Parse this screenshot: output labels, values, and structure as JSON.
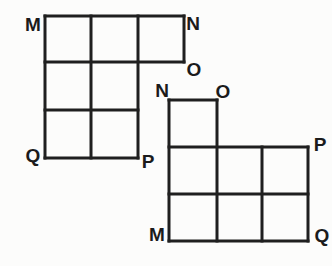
{
  "diagram": {
    "background": "#fcfcfb",
    "line_color": "#1f1f1f",
    "line_width": 3,
    "label_color": "#1b1b1b",
    "figures": [
      {
        "name": "figure-left",
        "segments": [
          {
            "x1": 45,
            "y1": 16,
            "x2": 184,
            "y2": 16
          },
          {
            "x1": 45,
            "y1": 62,
            "x2": 184,
            "y2": 62
          },
          {
            "x1": 45,
            "y1": 110,
            "x2": 138,
            "y2": 110
          },
          {
            "x1": 45,
            "y1": 158,
            "x2": 138,
            "y2": 158
          },
          {
            "x1": 45,
            "y1": 16,
            "x2": 45,
            "y2": 158
          },
          {
            "x1": 91,
            "y1": 16,
            "x2": 91,
            "y2": 158
          },
          {
            "x1": 138,
            "y1": 16,
            "x2": 138,
            "y2": 158
          },
          {
            "x1": 184,
            "y1": 16,
            "x2": 184,
            "y2": 62
          }
        ],
        "labels": [
          {
            "text": "M",
            "x": 33,
            "y": 24
          },
          {
            "text": "N",
            "x": 193,
            "y": 23
          },
          {
            "text": "O",
            "x": 194,
            "y": 69
          },
          {
            "text": "Q",
            "x": 33,
            "y": 155
          },
          {
            "text": "P",
            "x": 148,
            "y": 161
          }
        ]
      },
      {
        "name": "figure-right",
        "segments": [
          {
            "x1": 169,
            "y1": 100,
            "x2": 217,
            "y2": 100
          },
          {
            "x1": 169,
            "y1": 147,
            "x2": 308,
            "y2": 147
          },
          {
            "x1": 169,
            "y1": 194,
            "x2": 308,
            "y2": 194
          },
          {
            "x1": 169,
            "y1": 241,
            "x2": 308,
            "y2": 241
          },
          {
            "x1": 169,
            "y1": 100,
            "x2": 169,
            "y2": 241
          },
          {
            "x1": 217,
            "y1": 100,
            "x2": 217,
            "y2": 241
          },
          {
            "x1": 262,
            "y1": 147,
            "x2": 262,
            "y2": 241
          },
          {
            "x1": 308,
            "y1": 147,
            "x2": 308,
            "y2": 241
          }
        ],
        "labels": [
          {
            "text": "N",
            "x": 162,
            "y": 90
          },
          {
            "text": "O",
            "x": 223,
            "y": 91
          },
          {
            "text": "P",
            "x": 320,
            "y": 144
          },
          {
            "text": "M",
            "x": 157,
            "y": 234
          },
          {
            "text": "Q",
            "x": 322,
            "y": 235
          }
        ]
      }
    ]
  }
}
